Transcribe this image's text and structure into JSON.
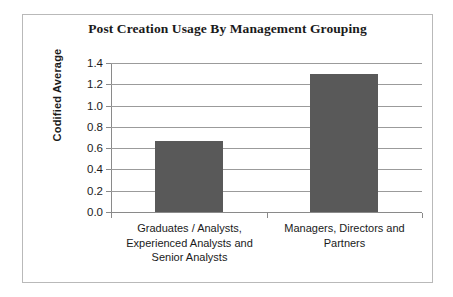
{
  "chart_data": {
    "type": "bar",
    "title": "Post Creation Usage By Management Grouping",
    "xlabel": "",
    "ylabel": "Codified Average",
    "categories": [
      "Graduates / Analysts, Experienced Analysts and Senior Analysts",
      "Managers, Directors and Partners"
    ],
    "values": [
      0.67,
      1.3
    ],
    "ylim": [
      0.0,
      1.4
    ],
    "ytick_labels": [
      "0.0",
      "0.2",
      "0.4",
      "0.6",
      "0.8",
      "1.0",
      "1.2",
      "1.4"
    ],
    "ytick_values": [
      0.0,
      0.2,
      0.4,
      0.6,
      0.8,
      1.0,
      1.2,
      1.4
    ],
    "grid": true,
    "legend": false,
    "bar_color": "#595959",
    "gridline_color": "#9b9b9b",
    "axis_color": "#8a8a8a",
    "frame_color": "#b9b9b9",
    "background_color": "#ffffff"
  }
}
